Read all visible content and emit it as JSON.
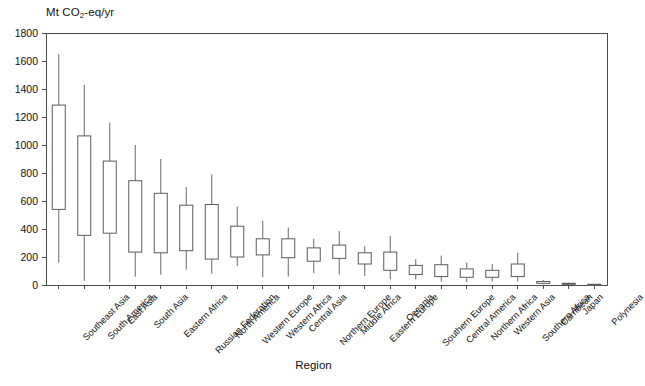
{
  "chart_data": {
    "type": "box",
    "title": "",
    "ylabel": "Mt CO2-eq/yr",
    "ylabel_parts": {
      "prefix": "Mt CO",
      "sub": "2",
      "suffix": "-eq/yr"
    },
    "xlabel": "Region",
    "ylim": [
      0,
      1800
    ],
    "yticks": [
      0,
      200,
      400,
      600,
      800,
      1000,
      1200,
      1400,
      1600,
      1800
    ],
    "grid": false,
    "legend": "none",
    "categories": [
      "Southeast Asia",
      "South America",
      "East Asia",
      "South Asia",
      "Eastern Africa",
      "Russian Federation",
      "North America",
      "Western Europe",
      "Western Africa",
      "Central Asia",
      "Northern Europe",
      "Middle Africa",
      "Eastern Europe",
      "Oceania",
      "Southern Europe",
      "Central America",
      "Northern Africa",
      "Western Asia",
      "Southern Africa",
      "Carribean",
      "Japan",
      "Polynesia"
    ],
    "boxes": [
      {
        "region": "Southeast Asia",
        "whisker_low": 160,
        "q1": 540,
        "q3": 1285,
        "whisker_high": 1650
      },
      {
        "region": "South America",
        "whisker_low": 30,
        "q1": 355,
        "q3": 1065,
        "whisker_high": 1430
      },
      {
        "region": "East Asia",
        "whisker_low": 20,
        "q1": 370,
        "q3": 885,
        "whisker_high": 1160
      },
      {
        "region": "South Asia",
        "whisker_low": 60,
        "q1": 235,
        "q3": 745,
        "whisker_high": 1000
      },
      {
        "region": "Eastern Africa",
        "whisker_low": 75,
        "q1": 230,
        "q3": 655,
        "whisker_high": 900
      },
      {
        "region": "Russian Federation",
        "whisker_low": 110,
        "q1": 245,
        "q3": 570,
        "whisker_high": 700
      },
      {
        "region": "North America",
        "whisker_low": 80,
        "q1": 185,
        "q3": 575,
        "whisker_high": 790
      },
      {
        "region": "Western Europe",
        "whisker_low": 135,
        "q1": 200,
        "q3": 420,
        "whisker_high": 560
      },
      {
        "region": "Western Africa",
        "whisker_low": 55,
        "q1": 215,
        "q3": 330,
        "whisker_high": 460
      },
      {
        "region": "Central Asia",
        "whisker_low": 60,
        "q1": 195,
        "q3": 330,
        "whisker_high": 410
      },
      {
        "region": "Northern Europe",
        "whisker_low": 85,
        "q1": 170,
        "q3": 265,
        "whisker_high": 330
      },
      {
        "region": "Middle Africa",
        "whisker_low": 75,
        "q1": 190,
        "q3": 285,
        "whisker_high": 385
      },
      {
        "region": "Eastern Europe",
        "whisker_low": 65,
        "q1": 150,
        "q3": 230,
        "whisker_high": 280
      },
      {
        "region": "Oceania",
        "whisker_low": 40,
        "q1": 105,
        "q3": 235,
        "whisker_high": 350
      },
      {
        "region": "Southern Europe",
        "whisker_low": 40,
        "q1": 75,
        "q3": 140,
        "whisker_high": 185
      },
      {
        "region": "Central America",
        "whisker_low": 25,
        "q1": 60,
        "q3": 145,
        "whisker_high": 210
      },
      {
        "region": "Northern Africa",
        "whisker_low": 20,
        "q1": 55,
        "q3": 115,
        "whisker_high": 160
      },
      {
        "region": "Western Asia",
        "whisker_low": 25,
        "q1": 55,
        "q3": 105,
        "whisker_high": 150
      },
      {
        "region": "Southern Africa",
        "whisker_low": 25,
        "q1": 60,
        "q3": 150,
        "whisker_high": 230
      },
      {
        "region": "Carribean",
        "whisker_low": 5,
        "q1": 12,
        "q3": 25,
        "whisker_high": 35
      },
      {
        "region": "Japan",
        "whisker_low": 3,
        "q1": 6,
        "q3": 12,
        "whisker_high": 16
      },
      {
        "region": "Polynesia",
        "whisker_low": 1,
        "q1": 2,
        "q3": 5,
        "whisker_high": 7
      }
    ]
  }
}
